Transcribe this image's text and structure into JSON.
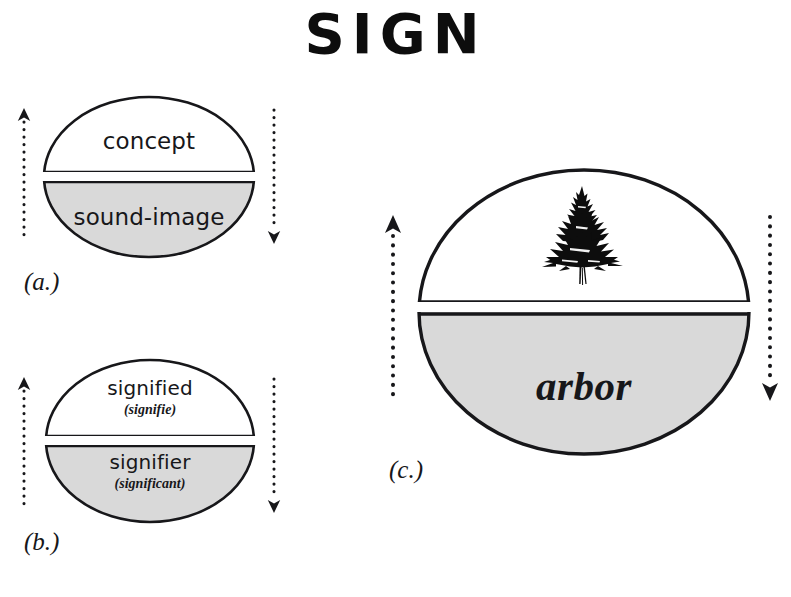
{
  "page": {
    "title": "SIGN",
    "background_color": "#ffffff",
    "ink_color": "#17171a",
    "shaded_half_color": "#d9d9d9",
    "unshaded_half_color": "#ffffff"
  },
  "diagrams": [
    {
      "id": "a",
      "caption": "(a.)",
      "upper_half": {
        "label": "concept",
        "sublabel": "",
        "fill": "#ffffff"
      },
      "lower_half": {
        "label": "sound-image",
        "sublabel": "",
        "fill": "#d9d9d9"
      },
      "left_arrow": {
        "direction": "up",
        "style": "dotted"
      },
      "right_arrow": {
        "direction": "down",
        "style": "dotted"
      }
    },
    {
      "id": "b",
      "caption": "(b.)",
      "upper_half": {
        "label": "signified",
        "sublabel": "(signifie)",
        "fill": "#ffffff"
      },
      "lower_half": {
        "label": "signifier",
        "sublabel": "(significant)",
        "fill": "#d9d9d9"
      },
      "left_arrow": {
        "direction": "up",
        "style": "dotted"
      },
      "right_arrow": {
        "direction": "down",
        "style": "dotted"
      }
    },
    {
      "id": "c",
      "caption": "(c.)",
      "upper_half": {
        "label": "",
        "sublabel": "",
        "fill": "#ffffff",
        "image": "fir-tree-silhouette"
      },
      "lower_half": {
        "label": "arbor",
        "sublabel": "",
        "fill": "#d9d9d9"
      },
      "left_arrow": {
        "direction": "up",
        "style": "dotted"
      },
      "right_arrow": {
        "direction": "down",
        "style": "dotted"
      }
    }
  ]
}
